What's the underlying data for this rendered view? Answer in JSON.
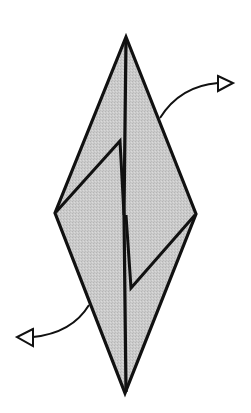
{
  "diagram": {
    "type": "origami-fold-step",
    "colors": {
      "paper_fill": "#c9c9c9",
      "outline": "#111111",
      "background": "#ffffff",
      "arrowhead_fill": "#ffffff"
    },
    "shape": {
      "top": [
        126,
        37
      ],
      "right": [
        196,
        214
      ],
      "bottom": [
        125,
        393
      ],
      "left": [
        55,
        213
      ]
    },
    "flaps": [
      {
        "name": "left-flap",
        "points": [
          [
            55,
            213
          ],
          [
            120,
            141
          ],
          [
            125,
            215
          ]
        ]
      },
      {
        "name": "right-flap",
        "points": [
          [
            196,
            214
          ],
          [
            131,
            288
          ],
          [
            126,
            215
          ]
        ]
      }
    ],
    "arrows": [
      {
        "name": "upper-right-arrow",
        "direction": "out-right",
        "start": [
          160,
          118
        ],
        "end": [
          218,
          83
        ]
      },
      {
        "name": "lower-left-arrow",
        "direction": "out-left",
        "start": [
          89,
          305
        ],
        "end": [
          33,
          337
        ]
      }
    ]
  }
}
